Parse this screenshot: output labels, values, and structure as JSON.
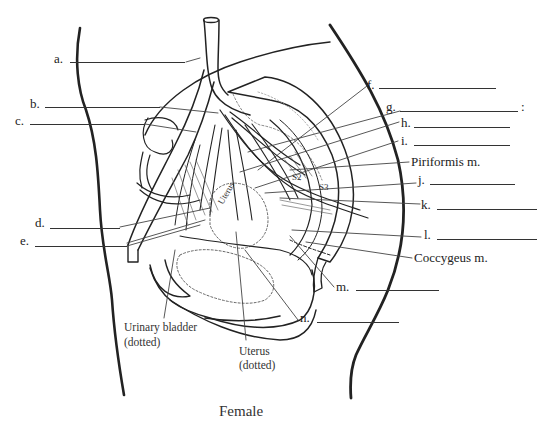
{
  "diagram": {
    "title": "Female",
    "blank_labels": [
      {
        "letter": "a.",
        "x": 54,
        "y": 55,
        "line_x": 70,
        "line_w": 115,
        "line_y": 62
      },
      {
        "letter": "b.",
        "x": 30,
        "y": 98,
        "line_x": 45,
        "line_w": 115,
        "line_y": 107
      },
      {
        "letter": "c.",
        "x": 15,
        "y": 116,
        "line_x": 30,
        "line_w": 115,
        "line_y": 124
      },
      {
        "letter": "d.",
        "x": 35,
        "y": 218,
        "line_x": 50,
        "line_w": 70,
        "line_y": 228
      },
      {
        "letter": "e.",
        "x": 20,
        "y": 236,
        "line_x": 35,
        "line_w": 92,
        "line_y": 246
      },
      {
        "letter": "f.",
        "x": 367,
        "y": 80,
        "line_x": 379,
        "line_w": 117,
        "line_y": 88
      },
      {
        "letter": "g.",
        "x": 386,
        "y": 100,
        "line_x": 400,
        "line_w": 118,
        "line_y": 111
      },
      {
        "letter": "h.",
        "x": 401,
        "y": 117,
        "line_x": 414,
        "line_w": 96,
        "line_y": 127
      },
      {
        "letter": "i.",
        "x": 401,
        "y": 136,
        "line_x": 414,
        "line_w": 96,
        "line_y": 145
      },
      {
        "letter": "j.",
        "x": 418,
        "y": 173,
        "line_x": 430,
        "line_w": 85,
        "line_y": 184
      },
      {
        "letter": "k.",
        "x": 421,
        "y": 197,
        "line_x": 437,
        "line_w": 100,
        "line_y": 209
      },
      {
        "letter": "l.",
        "x": 423,
        "y": 231,
        "line_x": 437,
        "line_w": 100,
        "line_y": 239
      },
      {
        "letter": "m.",
        "x": 336,
        "y": 279,
        "line_x": 356,
        "line_w": 83,
        "line_y": 290
      },
      {
        "letter": "n.",
        "x": 300,
        "y": 314,
        "line_x": 317,
        "line_w": 82,
        "line_y": 322
      }
    ],
    "g_suffix": ":",
    "named_labels": [
      {
        "text": "Piriformis m.",
        "x": 411,
        "y": 156
      },
      {
        "text": "Coccygeus m.",
        "x": 414,
        "y": 252
      }
    ],
    "captions": [
      {
        "text": "Urinary bladder",
        "x": 124,
        "y": 320
      },
      {
        "text": "(dotted)",
        "x": 124,
        "y": 335
      },
      {
        "text": "Uterus",
        "x": 239,
        "y": 344
      },
      {
        "text": "(dotted)",
        "x": 239,
        "y": 358
      }
    ],
    "sacral_markers": [
      "S2",
      "S3"
    ],
    "organ_text": "Uterus"
  }
}
